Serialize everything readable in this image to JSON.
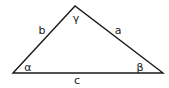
{
  "diagram": {
    "type": "triangle",
    "vertices": {
      "A": [
        13,
        73
      ],
      "C": [
        75,
        6
      ],
      "B": [
        163,
        73
      ]
    },
    "stroke_color": "#1a1a1a",
    "labels": {
      "side_b": "b",
      "side_a": "a",
      "side_c": "c",
      "angle_alpha": "α",
      "angle_beta": "β",
      "angle_gamma": "γ"
    }
  }
}
